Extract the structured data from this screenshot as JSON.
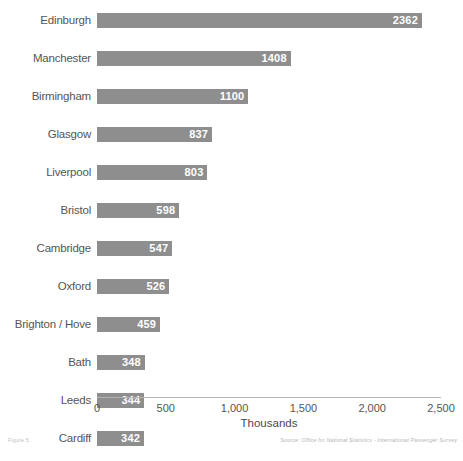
{
  "chart_data": {
    "type": "bar",
    "orientation": "horizontal",
    "title": "",
    "xlabel": "Thousands",
    "ylabel": "",
    "xlim": [
      0,
      2500
    ],
    "grid": false,
    "legend": null,
    "categories": [
      "Edinburgh",
      "Manchester",
      "Birmingham",
      "Glasgow",
      "Liverpool",
      "Bristol",
      "Cambridge",
      "Oxford",
      "Brighton / Hove",
      "Bath",
      "Leeds",
      "Cardiff",
      "Inverness",
      "York",
      "Aberdeen",
      "Nottingham",
      "Luton",
      "Newcastle-upon-Tyne",
      "Leicester",
      "Dover"
    ],
    "values": [
      2362,
      1408,
      1100,
      837,
      803,
      598,
      547,
      526,
      459,
      348,
      344,
      342,
      313,
      278,
      238,
      233,
      216,
      214,
      210,
      207
    ],
    "value_labels": [
      "2362",
      "1408",
      "1100",
      "837",
      "803",
      "598",
      "547",
      "526",
      "459",
      "348",
      "344",
      "342",
      "313",
      "278",
      "238",
      "233",
      "216",
      "214",
      "210",
      "207"
    ],
    "xticks": [
      0,
      500,
      1000,
      1500,
      2000,
      2500
    ],
    "xtick_labels": [
      "0",
      "500",
      "1,000",
      "1,500",
      "2,000",
      "2,500"
    ],
    "bar_color": "#8e8e8e",
    "value_label_color": "#ffffff",
    "category_label_color": "#555555",
    "axis_color": "#b4b4b4"
  },
  "footer": {
    "figure_caption": "Figure 5",
    "source": "Source: Office for National Statistics - International Passenger Survey"
  }
}
